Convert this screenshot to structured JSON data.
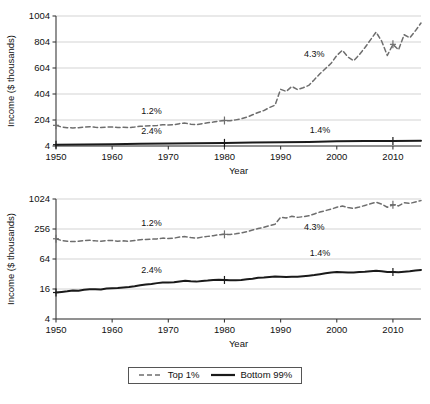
{
  "figure": {
    "background": "#ffffff",
    "axis_color": "#3a3a3a",
    "grid_color": "#c8c8c8",
    "top1_color": "#6e6e6e",
    "bottom99_color": "#1a1a1a"
  },
  "legend": {
    "position": "bottom-center",
    "entries": [
      {
        "label": "Top 1%",
        "style": "dashed",
        "color": "#6e6e6e"
      },
      {
        "label": "Bottom 99%",
        "style": "solid",
        "color": "#1a1a1a"
      }
    ]
  },
  "chart_data": [
    {
      "id": "top-panel",
      "type": "line",
      "title": "",
      "xlabel": "Year",
      "ylabel": "Income ($ thousands)",
      "yscale": "linear",
      "xlim": [
        1950,
        2015
      ],
      "ylim": [
        4,
        1004
      ],
      "xticks": [
        1950,
        1960,
        1970,
        1980,
        1990,
        2000,
        2010
      ],
      "yticks": [
        4,
        204,
        404,
        604,
        804,
        1004
      ],
      "grid": true,
      "legend_position": "figure-bottom",
      "annotations": [
        {
          "text": "1.2%",
          "x": 1967,
          "y": 250
        },
        {
          "text": "2.4%",
          "x": 1967,
          "y": 95
        },
        {
          "text": "4.3%",
          "x": 1996,
          "y": 690
        },
        {
          "text": "1.4%",
          "x": 1997,
          "y": 105
        }
      ],
      "markers": {
        "years": [
          1950,
          1980,
          2010
        ],
        "style": "plus"
      },
      "series": [
        {
          "name": "Top 1%",
          "style": "dashed",
          "color": "#6e6e6e",
          "x": [
            1950,
            1951,
            1952,
            1953,
            1954,
            1955,
            1956,
            1957,
            1958,
            1959,
            1960,
            1961,
            1962,
            1963,
            1964,
            1965,
            1966,
            1967,
            1968,
            1969,
            1970,
            1971,
            1972,
            1973,
            1974,
            1975,
            1976,
            1977,
            1978,
            1979,
            1980,
            1981,
            1982,
            1983,
            1984,
            1985,
            1986,
            1987,
            1988,
            1989,
            1990,
            1991,
            1992,
            1993,
            1994,
            1995,
            1996,
            1997,
            1998,
            1999,
            2000,
            2001,
            2002,
            2003,
            2004,
            2005,
            2006,
            2007,
            2008,
            2009,
            2010,
            2011,
            2012,
            2013,
            2014,
            2015
          ],
          "y": [
            163,
            150,
            145,
            143,
            145,
            150,
            152,
            148,
            146,
            150,
            150,
            146,
            148,
            145,
            150,
            156,
            158,
            160,
            162,
            168,
            165,
            168,
            176,
            180,
            172,
            168,
            176,
            182,
            188,
            196,
            200,
            198,
            205,
            214,
            226,
            244,
            262,
            276,
            300,
            318,
            440,
            424,
            462,
            438,
            452,
            470,
            514,
            560,
            600,
            640,
            700,
            740,
            688,
            660,
            706,
            760,
            820,
            880,
            810,
            700,
            786,
            744,
            860,
            836,
            890,
            950
          ]
        },
        {
          "name": "Bottom 99%",
          "style": "solid",
          "color": "#1a1a1a",
          "x": [
            1950,
            1955,
            1960,
            1965,
            1970,
            1975,
            1980,
            1985,
            1990,
            1995,
            2000,
            2005,
            2010,
            2015
          ],
          "y": [
            14,
            16,
            18,
            21,
            24,
            25,
            28,
            30,
            33,
            35,
            40,
            42,
            43,
            45
          ]
        }
      ]
    },
    {
      "id": "bottom-panel",
      "type": "line",
      "title": "",
      "xlabel": "Year",
      "ylabel": "Income ($ thousands)",
      "yscale": "log",
      "xlim": [
        1950,
        2015
      ],
      "ylim": [
        4,
        1024
      ],
      "xticks": [
        1950,
        1960,
        1970,
        1980,
        1990,
        2000,
        2010
      ],
      "yticks": [
        4,
        16,
        64,
        256,
        1024
      ],
      "grid": true,
      "legend_position": "figure-bottom",
      "annotations": [
        {
          "text": "1.2%",
          "x": 1967,
          "y": 290
        },
        {
          "text": "2.4%",
          "x": 1967,
          "y": 33
        },
        {
          "text": "4.3%",
          "x": 1996,
          "y": 250
        },
        {
          "text": "1.4%",
          "x": 1997,
          "y": 72
        }
      ],
      "markers": {
        "years": [
          1950,
          1980,
          2010
        ],
        "style": "plus"
      },
      "series": [
        {
          "name": "Top 1%",
          "style": "dashed",
          "color": "#6e6e6e",
          "x": [
            1950,
            1951,
            1952,
            1953,
            1954,
            1955,
            1956,
            1957,
            1958,
            1959,
            1960,
            1961,
            1962,
            1963,
            1964,
            1965,
            1966,
            1967,
            1968,
            1969,
            1970,
            1971,
            1972,
            1973,
            1974,
            1975,
            1976,
            1977,
            1978,
            1979,
            1980,
            1981,
            1982,
            1983,
            1984,
            1985,
            1986,
            1987,
            1988,
            1989,
            1990,
            1991,
            1992,
            1993,
            1994,
            1995,
            1996,
            1997,
            1998,
            1999,
            2000,
            2001,
            2002,
            2003,
            2004,
            2005,
            2006,
            2007,
            2008,
            2009,
            2010,
            2011,
            2012,
            2013,
            2014,
            2015
          ],
          "y": [
            163,
            150,
            145,
            143,
            145,
            150,
            152,
            148,
            146,
            150,
            150,
            146,
            148,
            145,
            150,
            156,
            158,
            160,
            162,
            168,
            165,
            168,
            176,
            180,
            172,
            168,
            176,
            182,
            188,
            196,
            200,
            198,
            205,
            214,
            226,
            244,
            262,
            276,
            300,
            318,
            440,
            424,
            462,
            438,
            452,
            470,
            514,
            560,
            600,
            640,
            700,
            740,
            688,
            660,
            706,
            760,
            820,
            880,
            810,
            700,
            786,
            744,
            860,
            836,
            890,
            950
          ]
        },
        {
          "name": "Bottom 99%",
          "style": "solid",
          "color": "#1a1a1a",
          "x": [
            1950,
            1951,
            1952,
            1953,
            1954,
            1955,
            1956,
            1957,
            1958,
            1959,
            1960,
            1961,
            1962,
            1963,
            1964,
            1965,
            1966,
            1967,
            1968,
            1969,
            1970,
            1971,
            1972,
            1973,
            1974,
            1975,
            1976,
            1977,
            1978,
            1979,
            1980,
            1981,
            1982,
            1983,
            1984,
            1985,
            1986,
            1987,
            1988,
            1989,
            1990,
            1991,
            1992,
            1993,
            1994,
            1995,
            1996,
            1997,
            1998,
            1999,
            2000,
            2001,
            2002,
            2003,
            2004,
            2005,
            2006,
            2007,
            2008,
            2009,
            2010,
            2011,
            2012,
            2013,
            2014,
            2015
          ],
          "y": [
            13.6,
            14.0,
            14.4,
            14.9,
            14.8,
            15.4,
            15.9,
            15.9,
            15.7,
            16.3,
            16.5,
            16.7,
            17.2,
            17.6,
            18.2,
            19.0,
            19.7,
            20.2,
            21.0,
            21.7,
            21.6,
            21.8,
            22.7,
            23.3,
            22.8,
            22.5,
            23.2,
            23.6,
            24.3,
            24.6,
            24.3,
            24.1,
            24.0,
            24.2,
            25.1,
            25.8,
            26.8,
            27.2,
            27.8,
            28.5,
            28.3,
            27.8,
            28.2,
            28.3,
            28.9,
            29.6,
            30.4,
            31.6,
            33.0,
            34.2,
            35.0,
            34.6,
            34.2,
            34.3,
            34.9,
            35.4,
            36.2,
            37.2,
            36.4,
            35.2,
            35.0,
            34.8,
            35.6,
            36.2,
            37.6,
            38.6
          ]
        }
      ]
    }
  ]
}
